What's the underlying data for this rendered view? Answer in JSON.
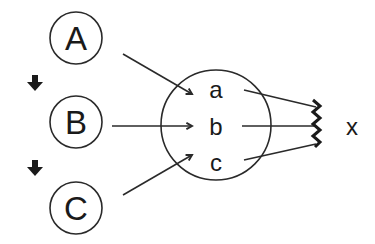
{
  "diagram": {
    "sources": [
      {
        "id": "A",
        "label": "A",
        "cx": 76,
        "cy": 38
      },
      {
        "id": "B",
        "label": "B",
        "cx": 76,
        "cy": 122
      },
      {
        "id": "C",
        "label": "C",
        "cx": 76,
        "cy": 208
      }
    ],
    "sequence_arrows": [
      {
        "from": "A",
        "to": "B",
        "icon": "down-arrow-icon"
      },
      {
        "from": "B",
        "to": "C",
        "icon": "down-arrow-icon"
      }
    ],
    "hub": {
      "items": [
        {
          "id": "a",
          "label": "a"
        },
        {
          "id": "b",
          "label": "b"
        },
        {
          "id": "c",
          "label": "c"
        }
      ]
    },
    "target": {
      "label": "x",
      "icon": "zigzag-junction-icon"
    },
    "connections": [
      {
        "from": "A",
        "to": "a"
      },
      {
        "from": "B",
        "to": "b"
      },
      {
        "from": "C",
        "to": "c"
      },
      {
        "from": "a",
        "to": "x"
      },
      {
        "from": "b",
        "to": "x"
      },
      {
        "from": "c",
        "to": "x"
      }
    ],
    "colors": {
      "stroke": "#2a2a2a",
      "background": "#ffffff"
    }
  }
}
